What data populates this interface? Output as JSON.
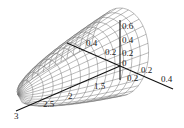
{
  "chart_data": {
    "type": "surface3d",
    "title": "",
    "axes": {
      "x": {
        "ticks": [
          "1.5",
          "2",
          "2.5",
          "3"
        ]
      },
      "y": {
        "ticks": [
          "0.4",
          "0.2",
          "0.2",
          "0.4"
        ]
      },
      "z": {
        "ticks": [
          "0.6",
          "0.4",
          "0.2",
          "0"
        ]
      }
    },
    "grid": false,
    "legend": null,
    "mesh_color": "#777777",
    "axis_color": "#111111"
  },
  "labels": {
    "x": [
      {
        "text": "3",
        "x": 14,
        "y": 119
      },
      {
        "text": "2.5",
        "x": 43,
        "y": 107
      },
      {
        "text": "2",
        "x": 68,
        "y": 99
      },
      {
        "text": "1.5",
        "x": 94,
        "y": 89
      }
    ],
    "y_back": [
      {
        "text": "0.4",
        "x": 86,
        "y": 46
      },
      {
        "text": "0.2",
        "x": 105,
        "y": 55
      }
    ],
    "y_front": [
      {
        "text": "0.2",
        "x": 141,
        "y": 73
      },
      {
        "text": "0.4",
        "x": 161,
        "y": 82
      }
    ],
    "z": [
      {
        "text": "0.6",
        "x": 122,
        "y": 29
      },
      {
        "text": "0.4",
        "x": 122,
        "y": 43
      },
      {
        "text": "0.2",
        "x": 122,
        "y": 56
      },
      {
        "text": "0",
        "x": 122,
        "y": 66
      }
    ],
    "neg": [
      {
        "text": "0.2",
        "x": 127,
        "y": 81
      }
    ]
  }
}
